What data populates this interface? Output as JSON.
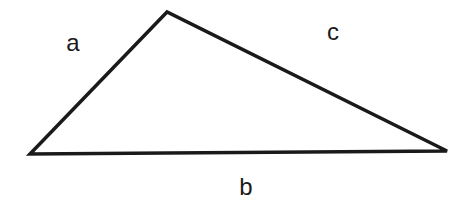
{
  "diagram": {
    "type": "triangle",
    "vertices": {
      "top": [
        167,
        12
      ],
      "left": [
        30,
        154
      ],
      "right": [
        447,
        151
      ]
    },
    "sides": [
      {
        "id": "a",
        "label": "a",
        "from": "left",
        "to": "top",
        "label_pos": [
          73,
          51
        ]
      },
      {
        "id": "b",
        "label": "b",
        "from": "left",
        "to": "right",
        "label_pos": [
          246,
          195
        ]
      },
      {
        "id": "c",
        "label": "c",
        "from": "top",
        "to": "right",
        "label_pos": [
          333,
          40
        ]
      }
    ],
    "stroke_color": "#1a1a1a",
    "background": "#ffffff"
  }
}
